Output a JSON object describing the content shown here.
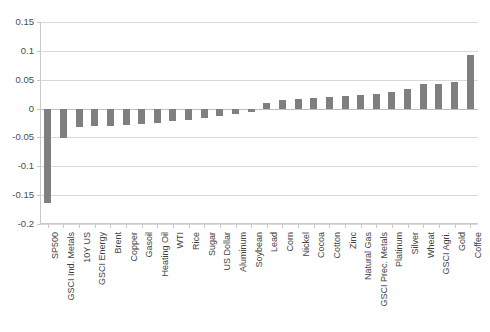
{
  "chart_data": {
    "type": "bar",
    "title": "",
    "subtitle": "",
    "xlabel": "",
    "ylabel": "",
    "ylim": [
      -0.2,
      0.15
    ],
    "yticks": [
      0.15,
      0.1,
      0.05,
      0,
      -0.05,
      -0.1,
      -0.15,
      -0.2
    ],
    "ytick_labels": [
      "0.15",
      "0.1",
      "0.05",
      "0",
      "-0.05",
      "-0.1",
      "-0.15",
      "-0.2"
    ],
    "grid": true,
    "legend": false,
    "legend_position": "none",
    "bar_color": "#7f7f7f",
    "gridline_color": "#d9d9d9",
    "axis_color": "#c9c9c9",
    "categories": [
      "SP500",
      "GSCI Ind. Metals",
      "10Y US",
      "GSCI Energy",
      "Brent",
      "Copper",
      "Gasoil",
      "Heating Oil",
      "WTI",
      "Rice",
      "Sugar",
      "US Dollar",
      "Aluminum",
      "Soybean",
      "Lead",
      "Corn",
      "Nickel",
      "Cocoa",
      "Cotton",
      "Zinc",
      "Natural Gas",
      "GSCI Prec. Metals",
      "Platinum",
      "Silver",
      "Wheat",
      "GSCI Agri.",
      "Gold",
      "Coffee"
    ],
    "values": [
      -0.163,
      -0.051,
      -0.032,
      -0.031,
      -0.03,
      -0.029,
      -0.027,
      -0.025,
      -0.022,
      -0.02,
      -0.016,
      -0.013,
      -0.009,
      -0.006,
      0.01,
      0.015,
      0.017,
      0.018,
      0.02,
      0.022,
      0.024,
      0.026,
      0.028,
      0.034,
      0.042,
      0.043,
      0.046,
      0.093
    ]
  }
}
